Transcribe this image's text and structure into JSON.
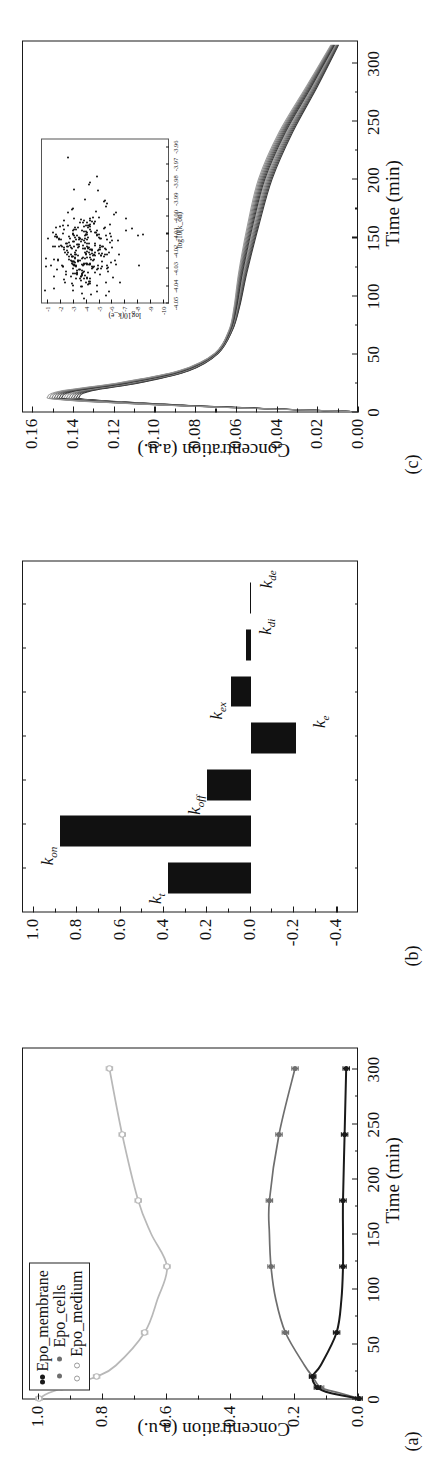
{
  "figure": {
    "panels": [
      {
        "letter": "(a)"
      },
      {
        "letter": "(b)"
      },
      {
        "letter": "(c)"
      }
    ]
  },
  "panel_a": {
    "letter": "(a)",
    "xlabel": "Time (min)",
    "ylabel": "Concentration (a.u.)",
    "xticks": [
      "0",
      "50",
      "100",
      "150",
      "200",
      "250",
      "300"
    ],
    "yticks": [
      "0.0",
      "0.2",
      "0.4",
      "0.6",
      "0.8",
      "1.0"
    ],
    "legend": [
      {
        "label": "Epo_membrane",
        "color": "#1a1a1a"
      },
      {
        "label": "Epo_cells",
        "color": "#6e6e6e"
      },
      {
        "label": "Epo_medium",
        "color": "#b5b5b5"
      }
    ]
  },
  "panel_b": {
    "letter": "(b)",
    "yticks": [
      "-0.4",
      "-0.2",
      "0.0",
      "0.2",
      "0.4",
      "0.6",
      "0.8",
      "1.0"
    ]
  },
  "panel_c": {
    "letter": "(c)",
    "xlabel": "Time (min)",
    "ylabel": "Concentration (a.u.)",
    "xticks": [
      "0",
      "50",
      "100",
      "150",
      "200",
      "250",
      "300"
    ],
    "yticks": [
      "0.00",
      "0.02",
      "0.04",
      "0.06",
      "0.08",
      "0.10",
      "0.12",
      "0.14",
      "0.16"
    ],
    "inset": {
      "xlabel": "log10(k_on)",
      "ylabel": "log10(k_e)",
      "xticks": [
        "-4.05",
        "-4.04",
        "-4.03",
        "-4.02",
        "-4.01",
        "-4.00",
        "-3.99",
        "-3.98",
        "-3.97",
        "-3.96"
      ],
      "yticks": [
        "-1",
        "-2",
        "-3",
        "-4",
        "-5",
        "-6",
        "-7",
        "-8",
        "-9",
        "-10"
      ]
    }
  },
  "chart_data": [
    {
      "type": "line",
      "panel": "a",
      "title": "",
      "xlabel": "Time (min)",
      "ylabel": "Concentration (a.u.)",
      "xlim": [
        0,
        320
      ],
      "ylim": [
        0.0,
        1.05
      ],
      "grid": false,
      "legend_position": "top-left",
      "x": [
        0,
        5,
        10,
        20,
        30,
        60,
        90,
        120,
        150,
        180,
        240,
        300
      ],
      "series": [
        {
          "name": "Epo_medium",
          "color": "#b8b8b8",
          "marker": "open-circle",
          "values": [
            1.0,
            0.97,
            0.92,
            0.82,
            0.76,
            0.67,
            0.63,
            0.6,
            0.65,
            0.69,
            0.74,
            0.78
          ],
          "data_points": [
            {
              "x": 0,
              "y": 1.0
            },
            {
              "x": 10,
              "y": 0.93
            },
            {
              "x": 20,
              "y": 0.82
            },
            {
              "x": 60,
              "y": 0.67
            },
            {
              "x": 120,
              "y": 0.6
            },
            {
              "x": 180,
              "y": 0.69
            },
            {
              "x": 240,
              "y": 0.74
            },
            {
              "x": 300,
              "y": 0.78
            }
          ]
        },
        {
          "name": "Epo_cells",
          "color": "#6e6e6e",
          "marker": "filled-circle",
          "values": [
            0.0,
            0.06,
            0.12,
            0.145,
            0.17,
            0.23,
            0.26,
            0.275,
            0.28,
            0.28,
            0.25,
            0.2
          ],
          "data_points": [
            {
              "x": 0,
              "y": 0.0
            },
            {
              "x": 10,
              "y": 0.12
            },
            {
              "x": 20,
              "y": 0.145
            },
            {
              "x": 60,
              "y": 0.23
            },
            {
              "x": 120,
              "y": 0.275
            },
            {
              "x": 180,
              "y": 0.28
            },
            {
              "x": 240,
              "y": 0.25
            },
            {
              "x": 300,
              "y": 0.2
            }
          ]
        },
        {
          "name": "Epo_membrane",
          "color": "#1a1a1a",
          "marker": "filled-circle",
          "values": [
            0.0,
            0.09,
            0.13,
            0.145,
            0.12,
            0.07,
            0.055,
            0.05,
            0.05,
            0.05,
            0.045,
            0.04
          ],
          "data_points": [
            {
              "x": 0,
              "y": 0.0
            },
            {
              "x": 10,
              "y": 0.13
            },
            {
              "x": 20,
              "y": 0.145
            },
            {
              "x": 60,
              "y": 0.07
            },
            {
              "x": 120,
              "y": 0.05
            },
            {
              "x": 180,
              "y": 0.05
            },
            {
              "x": 240,
              "y": 0.045
            },
            {
              "x": 300,
              "y": 0.04
            }
          ]
        }
      ]
    },
    {
      "type": "bar",
      "panel": "b",
      "title": "",
      "xlabel": "",
      "ylabel": "",
      "orientation": "vertical",
      "grid": false,
      "ylim": [
        -0.5,
        1.05
      ],
      "categories": [
        "k_t",
        "k_on",
        "k_off",
        "k_e",
        "k_ex",
        "k_di",
        "k_de"
      ],
      "category_labels": [
        "k<sub>t</sub>",
        "k<sub>on</sub>",
        "k<sub>off</sub>",
        "k<sub>e</sub>",
        "k<sub>ex</sub>",
        "k<sub>di</sub>",
        "k<sub>de</sub>"
      ],
      "values": [
        0.38,
        0.88,
        0.2,
        -0.21,
        0.09,
        0.02,
        0.0
      ],
      "bar_color": "#111111"
    },
    {
      "type": "line",
      "panel": "c",
      "title": "",
      "xlabel": "Time (min)",
      "ylabel": "Concentration (a.u.)",
      "xlim": [
        0,
        320
      ],
      "ylim": [
        0.0,
        0.165
      ],
      "grid": false,
      "n_trajectories": 14,
      "description": "Ensemble of model trajectories: sharp rise to ~0.145 peak near t=13 min, decay to plateau ~0.06 by t=80 min, slow decline to ~0.012 at t=315 min",
      "x": [
        0,
        5,
        10,
        13,
        18,
        25,
        35,
        50,
        70,
        90,
        120,
        160,
        200,
        240,
        280,
        315
      ],
      "representative": [
        0.0,
        0.085,
        0.138,
        0.145,
        0.138,
        0.112,
        0.086,
        0.07,
        0.063,
        0.06,
        0.057,
        0.052,
        0.046,
        0.036,
        0.023,
        0.012
      ],
      "spread": 0.006
    },
    {
      "type": "scatter",
      "panel": "c-inset",
      "title": "",
      "xlabel": "log10(k_on)",
      "ylabel": "log10(k_e)",
      "xlim": [
        -4.05,
        -3.955
      ],
      "ylim": [
        -10.5,
        -0.5
      ],
      "grid": false,
      "n_points": 320,
      "cluster_center": {
        "x": -4.022,
        "y": -3.6
      },
      "cluster_spread": {
        "x": 0.011,
        "y": 1.35
      },
      "marker_color": "#111111"
    }
  ]
}
